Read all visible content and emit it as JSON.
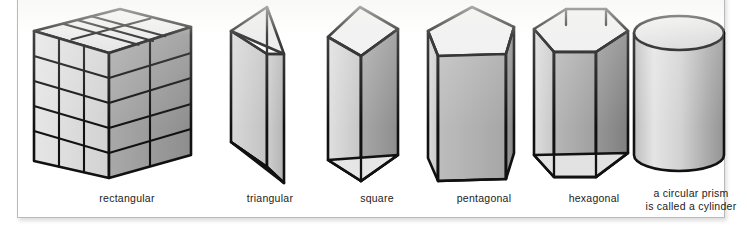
{
  "figure": {
    "kind": "geometry-illustration-panel",
    "background_color": "#ffffff",
    "border_color": "#b9b9b9",
    "ink_color": "#1b1b1b"
  },
  "palette": {
    "outline": "#111111",
    "face_light": "#e2e2e2",
    "face_mid": "#c5c5c5",
    "face_dark": "#9b9b9b",
    "face_top": "#efefef",
    "label_text": "#1b1b1b"
  },
  "shapes": [
    {
      "id": "rectangular",
      "label": "rectangular",
      "icon": "rectangular-prism-icon",
      "grid": {
        "columns": 3,
        "rows": 5,
        "depth": 2
      }
    },
    {
      "id": "triangular",
      "label": "triangular",
      "icon": "triangular-prism-icon",
      "sides": 3
    },
    {
      "id": "square",
      "label": "square",
      "icon": "square-prism-icon",
      "sides": 4
    },
    {
      "id": "pentagonal",
      "label": "pentagonal",
      "icon": "pentagonal-prism-icon",
      "sides": 5
    },
    {
      "id": "hexagonal",
      "label": "hexagonal",
      "icon": "hexagonal-prism-icon",
      "sides": 6
    },
    {
      "id": "cylinder",
      "label": "a circular prism\nis called a cylinder",
      "icon": "cylinder-icon",
      "sides": 0
    }
  ]
}
